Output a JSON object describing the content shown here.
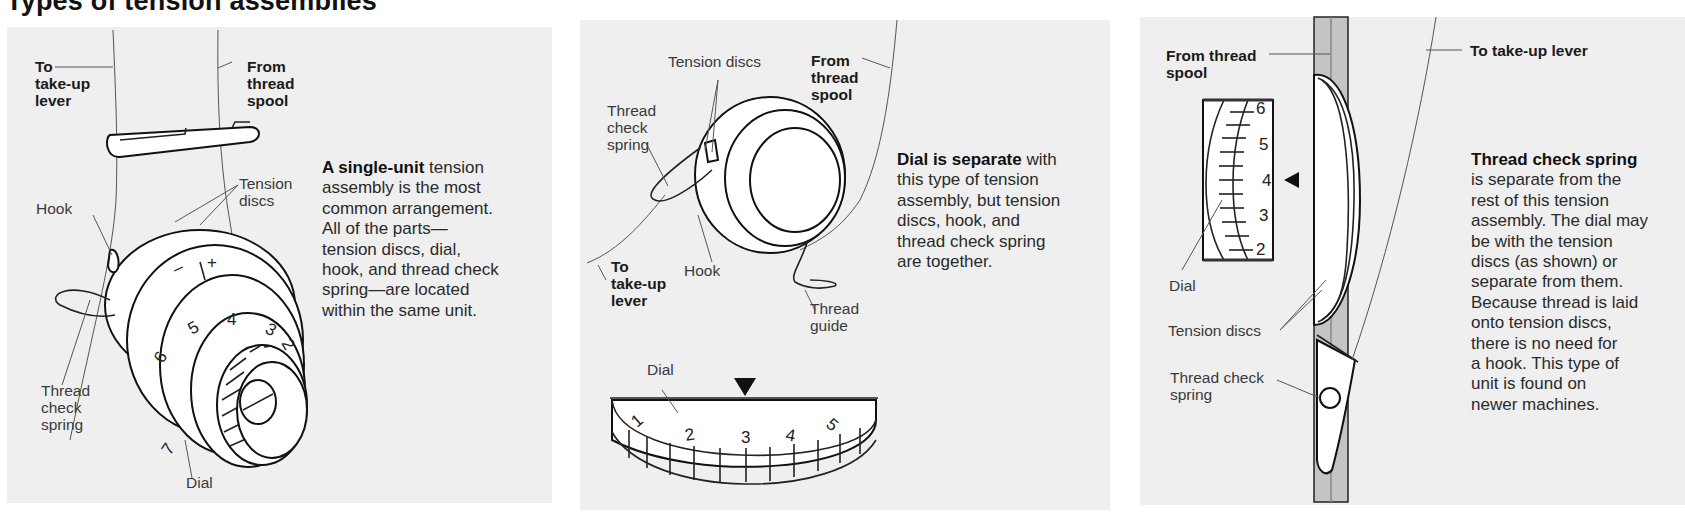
{
  "title": "Types of tension assemblies",
  "panels": [
    {
      "labels": {
        "to_takeup": "To\ntake-up\nlever",
        "from_spool": "From\nthread\nspool",
        "tension_discs": "Tension\ndiscs",
        "hook": "Hook",
        "thread_check_spring": "Thread\ncheck\nspring",
        "dial": "Dial"
      },
      "dial_marks": [
        "7",
        "6",
        "5",
        "4",
        "3",
        "2"
      ],
      "adjust_marks": [
        "–",
        "+"
      ],
      "description_bold": "A single-unit",
      "description_rest": " tension\nassembly is the most\ncommon arrangement.\nAll of the parts—\ntension discs, dial,\nhook, and thread check\nspring—are located\nwithin the same unit."
    },
    {
      "labels": {
        "tension_discs": "Tension discs",
        "from_spool": "From\nthread\nspool",
        "thread_check_spring": "Thread\ncheck\nspring",
        "to_takeup": "To\ntake-up\nlever",
        "hook": "Hook",
        "thread_guide": "Thread\nguide",
        "dial": "Dial"
      },
      "dial_marks": [
        "1",
        "2",
        "3",
        "4",
        "5"
      ],
      "description_bold": "Dial is separate",
      "description_rest": " with\nthis type of tension\nassembly, but tension\ndiscs, hook, and\nthread check spring\nare together."
    },
    {
      "labels": {
        "from_spool": "From thread\nspool",
        "to_takeup": "To take-up lever",
        "dial": "Dial",
        "tension_discs": "Tension discs",
        "thread_check_spring": "Thread check\nspring"
      },
      "dial_marks": [
        "6",
        "5",
        "4",
        "3",
        "2"
      ],
      "description_bold": "Thread check spring",
      "description_rest": "\nis separate from the\nrest of this tension\nassembly. The dial may\nbe with the tension\ndiscs (as shown) or\nseparate from them.\nBecause thread is laid\nonto tension discs,\nthere is no need for\na hook. This type of\nunit is found on\nnewer machines."
    }
  ],
  "colors": {
    "panel_bg": "#efefef",
    "line": "#222222",
    "bar_grey": "#b8b8b8"
  }
}
